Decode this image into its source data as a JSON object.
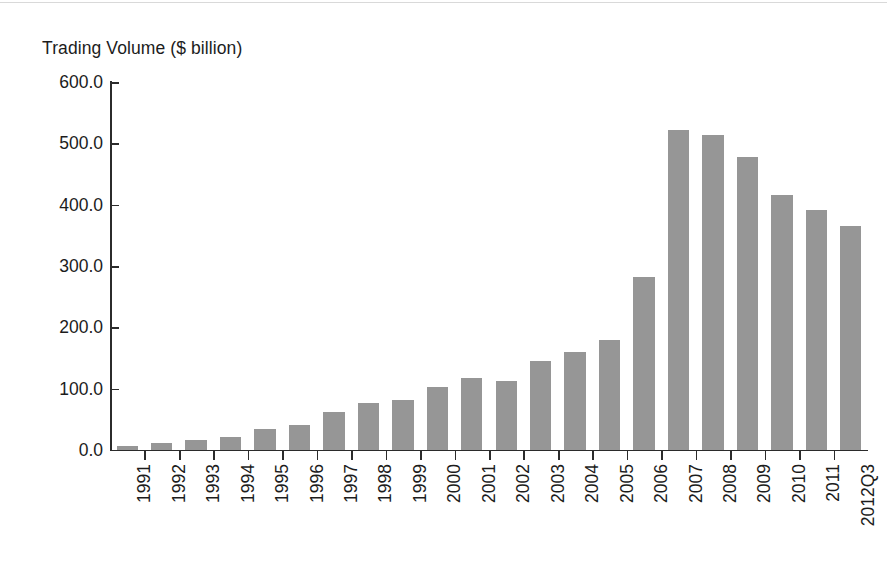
{
  "chart_data": {
    "type": "bar",
    "title": "Trading Volume ($ billion)",
    "xlabel": "",
    "ylabel": "Trading Volume ($ billion)",
    "ylim": [
      0,
      600
    ],
    "ytick_labels": [
      "600.0",
      "500.0",
      "400.0",
      "300.0",
      "200.0",
      "100.0",
      "0.0"
    ],
    "ytick_values": [
      600,
      500,
      400,
      300,
      200,
      100,
      0
    ],
    "grid": false,
    "legend": null,
    "bar_color": "#969696",
    "axis_color": "#2b2b2b",
    "categories": [
      "1991",
      "1992",
      "1993",
      "1994",
      "1995",
      "1996",
      "1997",
      "1998",
      "1999",
      "2000",
      "2001",
      "2002",
      "2003",
      "2004",
      "2005",
      "2006",
      "2007",
      "2008",
      "2009",
      "2010",
      "2011",
      "2012Q3"
    ],
    "values": [
      6,
      11,
      16,
      22,
      35,
      41,
      62,
      77,
      81,
      103,
      117,
      113,
      145,
      159,
      179,
      282,
      521,
      513,
      477,
      415,
      391,
      365
    ]
  }
}
